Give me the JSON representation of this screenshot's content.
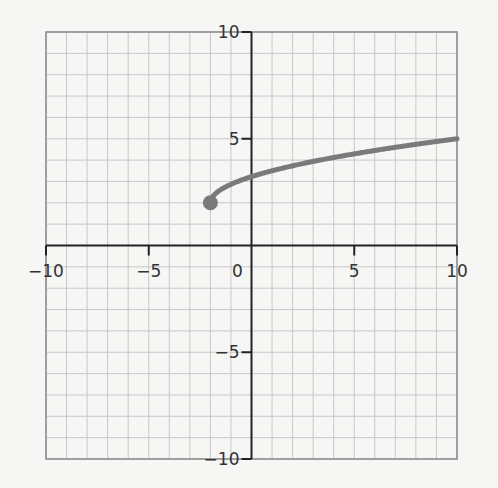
{
  "chart_data": {
    "type": "line",
    "title": "",
    "xlabel": "",
    "ylabel": "",
    "xlim": [
      -10,
      10
    ],
    "ylim": [
      -10,
      10
    ],
    "grid": true,
    "grid_step": 1,
    "x_ticks": [
      -10,
      -5,
      0,
      5,
      10
    ],
    "y_ticks": [
      -10,
      -5,
      5,
      10
    ],
    "x_tick_labels": [
      "−10",
      "−5",
      "0",
      "5",
      "10"
    ],
    "y_tick_labels": [
      "−10",
      "−5",
      "5",
      "10"
    ],
    "origin_label": "0",
    "series": [
      {
        "name": "curve",
        "color": "#7a7a7a",
        "start_point": {
          "x": -2,
          "y": 2,
          "marker": "closed-dot"
        },
        "x": [
          -2,
          -1,
          0,
          1,
          2,
          3,
          4,
          5,
          6,
          7,
          8,
          9,
          10
        ],
        "y": [
          2,
          2.87,
          3.23,
          3.5,
          3.73,
          3.94,
          4.13,
          4.3,
          4.46,
          4.61,
          4.75,
          4.88,
          5.0
        ]
      }
    ],
    "legend": null
  },
  "colors": {
    "background": "#f6f6f5",
    "grid": "#c8c8c8",
    "border": "#8a8a8a",
    "axis": "#222222",
    "curve": "#7a7a7a"
  }
}
